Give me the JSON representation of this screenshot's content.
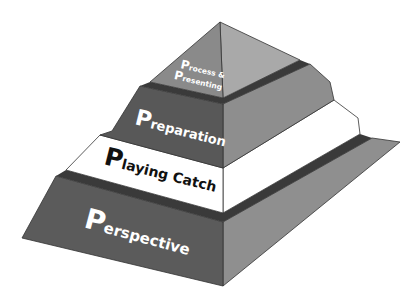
{
  "diagram": {
    "type": "pyramid",
    "levels": [
      {
        "cap": "P",
        "rest": "rocess &",
        "cap2": "P",
        "rest2": "resenting",
        "full": "Process & Presenting",
        "front": "#8a8a8a",
        "side": "#a9a9a9",
        "text_color": "#ffffff"
      },
      {
        "cap": "P",
        "rest": "reparation",
        "full": "Preparation",
        "front": "#585858",
        "side": "#8e8e8e",
        "text_color": "#ffffff"
      },
      {
        "cap": "P",
        "rest": "laying Catch",
        "full": "Playing Catch",
        "front": "#ffffff",
        "side": "#ffffff",
        "text_color": "#111111"
      },
      {
        "cap": "P",
        "rest": "erspective",
        "full": "Perspective",
        "front": "#5b5b5b",
        "side": "#8f8f8f",
        "text_color": "#ffffff"
      }
    ],
    "colors": {
      "outline": "#333333",
      "ledge": "#3a3a3a",
      "background": "#ffffff"
    }
  }
}
